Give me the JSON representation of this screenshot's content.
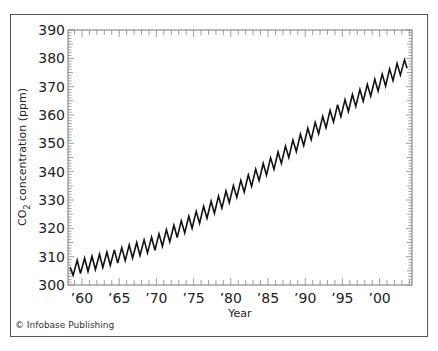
{
  "chart_data": {
    "type": "line",
    "title": "",
    "xlabel": "Year",
    "ylabel": "CO2 concentration (ppm)",
    "ylabel_main": "CO",
    "ylabel_sub": "2",
    "ylabel_rest": " concentration (ppm)",
    "xlim": [
      1958,
      2004
    ],
    "ylim": [
      300,
      390
    ],
    "grid": false,
    "legend": null,
    "x_ticks": [
      1960,
      1965,
      1970,
      1975,
      1980,
      1985,
      1990,
      1995,
      2000
    ],
    "x_tick_labels": [
      "’60",
      "’65",
      "’70",
      "’75",
      "’80",
      "’85",
      "’90",
      "’95",
      "’00"
    ],
    "y_ticks": [
      300,
      310,
      320,
      330,
      340,
      350,
      360,
      370,
      380,
      390
    ],
    "y_tick_labels": [
      "300",
      "310",
      "320",
      "330",
      "340",
      "350",
      "360",
      "370",
      "380",
      "390"
    ],
    "series": [
      {
        "name": "Atmospheric CO2 (seasonal cycle)",
        "color": "#111111",
        "seasonal_amplitude_ppm": 5,
        "annual_mean": {
          "years": [
            1958,
            1959,
            1960,
            1961,
            1962,
            1963,
            1964,
            1965,
            1966,
            1967,
            1968,
            1969,
            1970,
            1971,
            1972,
            1973,
            1974,
            1975,
            1976,
            1977,
            1978,
            1979,
            1980,
            1981,
            1982,
            1983,
            1984,
            1985,
            1986,
            1987,
            1988,
            1989,
            1990,
            1991,
            1992,
            1993,
            1994,
            1995,
            1996,
            1997,
            1998,
            1999,
            2000,
            2001,
            2002,
            2003
          ],
          "values": [
            305.5,
            306.0,
            306.7,
            307.4,
            308.1,
            308.8,
            309.6,
            310.4,
            311.3,
            312.2,
            313.1,
            314.0,
            315.0,
            316.5,
            318.0,
            319.6,
            321.2,
            322.9,
            324.6,
            326.4,
            328.2,
            330.0,
            331.9,
            333.8,
            335.7,
            337.7,
            339.7,
            341.7,
            343.7,
            345.8,
            347.9,
            350.0,
            352.1,
            354.2,
            356.3,
            358.4,
            360.5,
            362.3,
            364.1,
            365.9,
            367.7,
            369.5,
            371.3,
            373.1,
            375.0,
            377.0
          ]
        }
      }
    ]
  },
  "credit": "© Infobase Publishing"
}
